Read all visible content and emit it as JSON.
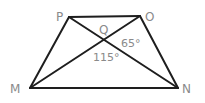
{
  "diagram": {
    "type": "trapezoid-with-diagonals",
    "vertices": {
      "P": {
        "label": "P",
        "x": 69,
        "y": 17
      },
      "O": {
        "label": "O",
        "x": 140,
        "y": 16
      },
      "M": {
        "label": "M",
        "x": 30,
        "y": 88
      },
      "N": {
        "label": "N",
        "x": 178,
        "y": 88
      },
      "Q": {
        "label": "Q",
        "x": 105,
        "y": 40
      }
    },
    "edges": [
      "PO",
      "OM",
      "PN",
      "MN",
      "PM",
      "ON"
    ],
    "angles": [
      {
        "label": "65°",
        "at": "Q",
        "between": "OQN"
      },
      {
        "label": "115°",
        "at": "Q",
        "between": "MQN"
      }
    ],
    "colors": {
      "line": "#1e1e1e",
      "text": "#8a8a8a"
    }
  }
}
